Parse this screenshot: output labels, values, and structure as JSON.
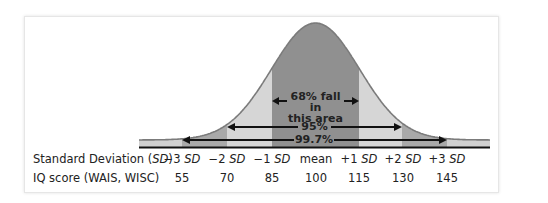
{
  "chart_data": {
    "type": "area",
    "title": "",
    "xlabel": "",
    "ylabel": "",
    "distribution": "normal",
    "mean": 100,
    "sd": 15,
    "rows": [
      {
        "label_prefix": "Standard Deviation (",
        "label_italic": "SD",
        "label_suffix": ")",
        "ticks": [
          {
            "sign": "−3 ",
            "unit": "SD"
          },
          {
            "sign": "−2 ",
            "unit": "SD"
          },
          {
            "sign": "−1 ",
            "unit": "SD"
          },
          {
            "sign": "mean",
            "unit": ""
          },
          {
            "sign": "+1 ",
            "unit": "SD"
          },
          {
            "sign": "+2 ",
            "unit": "SD"
          },
          {
            "sign": "+3 ",
            "unit": "SD"
          }
        ]
      },
      {
        "label": "IQ score (WAIS, WISC)",
        "values": [
          "55",
          "70",
          "85",
          "100",
          "115",
          "130",
          "145"
        ]
      }
    ],
    "categories": [
      "-3 SD",
      "-2 SD",
      "-1 SD",
      "mean",
      "+1 SD",
      "+2 SD",
      "+3 SD"
    ],
    "iq_values": [
      55,
      70,
      85,
      100,
      115,
      130,
      145
    ],
    "annotations": [
      {
        "text_line1": "68% fall in",
        "text_line2": "this area",
        "range": [
          "-1 SD",
          "+1 SD"
        ],
        "percent": 68
      },
      {
        "text": "95%",
        "range": [
          "-2 SD",
          "+2 SD"
        ],
        "percent": 95
      },
      {
        "text": "99.7%",
        "range": [
          "-3 SD",
          "+3 SD"
        ],
        "percent": 99.7
      }
    ],
    "band_colors": {
      "center": "#909090",
      "two_sd": "#d6d6d6",
      "three_sd": "#a9a9a9",
      "tail": "#d0d0d0",
      "outline": "#7b7b7b",
      "baseline": "#111111"
    }
  }
}
